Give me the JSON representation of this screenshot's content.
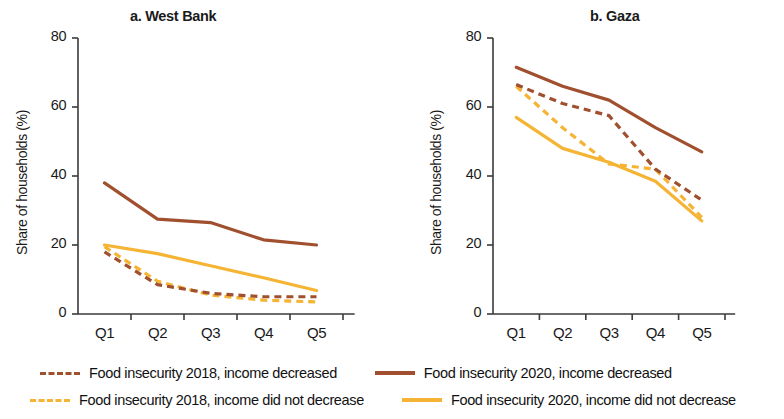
{
  "figure": {
    "panels": [
      {
        "id": "west",
        "title": "a. West Bank",
        "ylabel": "Share of households (%)"
      },
      {
        "id": "gaza",
        "title": "b. Gaza",
        "ylabel": "Share of households (%)"
      }
    ]
  },
  "axis": {
    "yticks": [
      "0",
      "20",
      "40",
      "60",
      "80"
    ],
    "xticks": [
      "Q1",
      "Q2",
      "Q3",
      "Q4",
      "Q5"
    ]
  },
  "legend": {
    "entries": [
      {
        "label": "Food insecurity 2018, income decreased",
        "color": "#A0502F",
        "style": "dashed"
      },
      {
        "label": "Food insecurity 2020, income decreased",
        "color": "#A0502F",
        "style": "solid"
      },
      {
        "label": "Food insecurity 2018, income did not decrease",
        "color": "#F5B433",
        "style": "dashed"
      },
      {
        "label": "Food insecurity 2020, income did not decrease",
        "color": "#F5B433",
        "style": "solid"
      }
    ]
  },
  "colors": {
    "decreased": "#A0502F",
    "not_decreased": "#F5B433",
    "axis": "#3a3a3a",
    "text": "#1a1a1a"
  },
  "chart_data": [
    {
      "type": "line",
      "title": "a. West Bank",
      "xlabel": "",
      "ylabel": "Share of households (%)",
      "categories": [
        "Q1",
        "Q2",
        "Q3",
        "Q4",
        "Q5"
      ],
      "ylim": [
        0,
        80
      ],
      "yticks": [
        0,
        20,
        40,
        60,
        80
      ],
      "grid": false,
      "legend_position": "below-figure",
      "series": [
        {
          "name": "Food insecurity 2018, income decreased",
          "style": "dashed",
          "color": "#A0502F",
          "values": [
            18.0,
            8.5,
            6.0,
            5.0,
            5.0
          ]
        },
        {
          "name": "Food insecurity 2020, income decreased",
          "style": "solid",
          "color": "#A0502F",
          "values": [
            38.0,
            27.5,
            26.5,
            21.5,
            20.0
          ]
        },
        {
          "name": "Food insecurity 2018, income did not decrease",
          "style": "dashed",
          "color": "#F5B433",
          "values": [
            19.5,
            9.5,
            5.5,
            4.0,
            3.5
          ]
        },
        {
          "name": "Food insecurity 2020, income did not decrease",
          "style": "solid",
          "color": "#F5B433",
          "values": [
            20.0,
            17.5,
            14.0,
            10.5,
            6.8
          ]
        }
      ]
    },
    {
      "type": "line",
      "title": "b. Gaza",
      "xlabel": "",
      "ylabel": "Share of households (%)",
      "categories": [
        "Q1",
        "Q2",
        "Q3",
        "Q4",
        "Q5"
      ],
      "ylim": [
        0,
        80
      ],
      "yticks": [
        0,
        20,
        40,
        60,
        80
      ],
      "grid": false,
      "legend_position": "below-figure",
      "series": [
        {
          "name": "Food insecurity 2018, income decreased",
          "style": "dashed",
          "color": "#A0502F",
          "values": [
            66.5,
            61.0,
            57.5,
            42.0,
            33.0
          ]
        },
        {
          "name": "Food insecurity 2020, income decreased",
          "style": "solid",
          "color": "#A0502F",
          "values": [
            71.5,
            66.0,
            62.0,
            54.0,
            47.0
          ]
        },
        {
          "name": "Food insecurity 2018, income did not decrease",
          "style": "dashed",
          "color": "#F5B433",
          "values": [
            66.0,
            54.0,
            43.5,
            42.0,
            28.0
          ]
        },
        {
          "name": "Food insecurity 2020, income did not decrease",
          "style": "solid",
          "color": "#F5B433",
          "values": [
            57.0,
            48.0,
            44.0,
            38.5,
            27.0
          ]
        }
      ]
    }
  ]
}
